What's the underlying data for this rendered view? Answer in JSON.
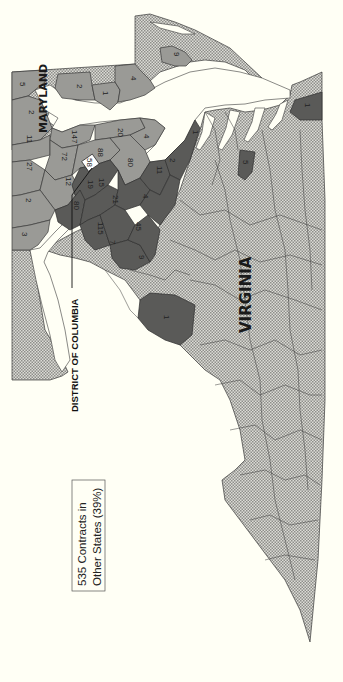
{
  "figure": {
    "orientation": "rotated 90° clockwise (text reads bottom-to-top)",
    "colors": {
      "background": "#fffff5",
      "no_contracts_pattern": "#c8c8c4",
      "some_contracts": "#9a9a96",
      "many_contracts": "#5a5a58",
      "border": "#3a3a3a"
    }
  },
  "labels": {
    "maryland": "MARYLAND",
    "virginia": "VIRGINIA",
    "dc": "DISTRICT OF COLUMBIA",
    "dc_value": "58"
  },
  "legend": {
    "line1": "535 Contracts in",
    "line2": "Other States (39%)"
  },
  "maryland_counties": [
    {
      "value": "5"
    },
    {
      "value": "2"
    },
    {
      "value": "1"
    },
    {
      "value": "4"
    },
    {
      "value": "9"
    },
    {
      "value": "2"
    },
    {
      "value": "11"
    },
    {
      "value": "27"
    },
    {
      "value": "147"
    },
    {
      "value": "20"
    },
    {
      "value": "4"
    },
    {
      "value": "72"
    },
    {
      "value": "88"
    },
    {
      "value": "80"
    },
    {
      "value": "12"
    },
    {
      "value": "2"
    },
    {
      "value": "3"
    }
  ],
  "virginia_counties": [
    {
      "value": "11"
    },
    {
      "value": "2"
    },
    {
      "value": "1"
    },
    {
      "value": "80"
    },
    {
      "value": "19"
    },
    {
      "value": "15"
    },
    {
      "value": "21"
    },
    {
      "value": "4"
    },
    {
      "value": "115"
    },
    {
      "value": "45"
    },
    {
      "value": "7"
    },
    {
      "value": "9"
    },
    {
      "value": "1"
    },
    {
      "value": "5"
    },
    {
      "value": "1"
    }
  ]
}
